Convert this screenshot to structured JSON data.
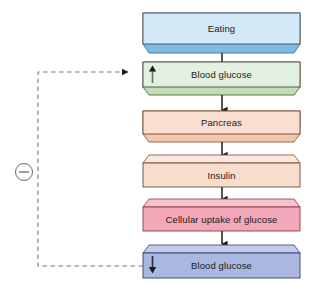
{
  "diagram": {
    "type": "flowchart",
    "orientation": "vertical",
    "background_color": "#ffffff",
    "nodes": [
      {
        "id": "eating",
        "label": "Eating",
        "fill": "#d4e9f7",
        "bevel_fill": "#7fbce4",
        "stroke": "#4a4a4a",
        "bevel_position": "bottom",
        "indicator": "none"
      },
      {
        "id": "blood-glucose-high",
        "label": "Blood glucose",
        "fill": "#e2f0df",
        "bevel_fill": "#c3ddb8",
        "stroke": "#4a4a4a",
        "bevel_position": "bottom",
        "indicator": "up-arrow"
      },
      {
        "id": "pancreas",
        "label": "Pancreas",
        "fill": "#fadfd0",
        "bevel_fill": "#f3c6ad",
        "stroke": "#6b4a3a",
        "bevel_position": "bottom",
        "indicator": "none"
      },
      {
        "id": "insulin",
        "label": "Insulin",
        "fill": "#f7ddcb",
        "bevel_fill": "#fbe9dd",
        "stroke": "#6b4a3a",
        "bevel_position": "top",
        "indicator": "none"
      },
      {
        "id": "cellular-uptake",
        "label": "Cellular uptake of glucose",
        "fill": "#f2a8b8",
        "bevel_fill": "#f7c3cf",
        "stroke": "#8a3a4a",
        "bevel_position": "top",
        "indicator": "none"
      },
      {
        "id": "blood-glucose-low",
        "label": "Blood glucose",
        "fill": "#a8b8e0",
        "bevel_fill": "#c2cdea",
        "stroke": "#3a3a6b",
        "bevel_position": "top",
        "indicator": "down-arrow"
      }
    ],
    "connectors": [
      {
        "id": "eating-to-glucose-high",
        "from": "eating",
        "to": "blood-glucose-high",
        "style": "solid",
        "arrow": "down"
      },
      {
        "id": "glucose-high-to-pancreas",
        "from": "blood-glucose-high",
        "to": "pancreas",
        "style": "solid",
        "arrow": "down"
      },
      {
        "id": "pancreas-to-insulin",
        "from": "pancreas",
        "to": "insulin",
        "style": "solid",
        "arrow": "down"
      },
      {
        "id": "insulin-to-uptake",
        "from": "insulin",
        "to": "cellular-uptake",
        "style": "solid",
        "arrow": "down"
      },
      {
        "id": "uptake-to-glucose-low",
        "from": "cellular-uptake",
        "to": "blood-glucose-low",
        "style": "solid",
        "arrow": "down"
      }
    ],
    "feedback_loop": {
      "id": "negative-feedback",
      "from": "blood-glucose-low",
      "to": "blood-glucose-high",
      "style": "dashed",
      "arrow": "right",
      "sign_symbol": "−",
      "sign_meaning": "negative",
      "stroke": "#777777"
    }
  }
}
